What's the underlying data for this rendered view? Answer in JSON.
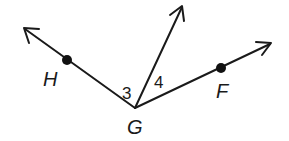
{
  "diagram": {
    "type": "angle-rays",
    "vertex": {
      "label": "G",
      "x": 135,
      "y": 108
    },
    "rays": [
      {
        "name": "ray-GH",
        "to": {
          "x": 24,
          "y": 28
        },
        "point": {
          "label": "H",
          "x": 67,
          "y": 60
        }
      },
      {
        "name": "ray-up",
        "to": {
          "x": 182,
          "y": 6
        }
      },
      {
        "name": "ray-GF",
        "to": {
          "x": 271,
          "y": 43
        },
        "point": {
          "label": "F",
          "x": 221,
          "y": 68
        }
      }
    ],
    "angles": [
      {
        "label": "3",
        "between": [
          "ray-GH",
          "ray-up"
        ]
      },
      {
        "label": "4",
        "between": [
          "ray-up",
          "ray-GF"
        ]
      }
    ],
    "labels": {
      "H": "H",
      "G": "G",
      "F": "F",
      "angle3": "3",
      "angle4": "4"
    },
    "colors": {
      "stroke": "#1a1a1a",
      "background": "#ffffff"
    }
  }
}
